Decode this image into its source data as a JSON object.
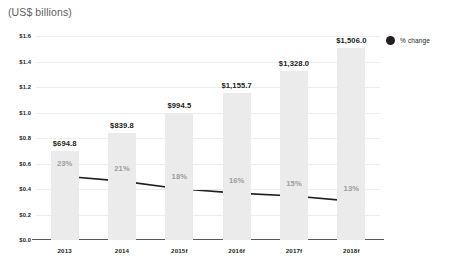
{
  "axis_unit_label": "(US$ billions)",
  "legend": {
    "marker_icon": "filled-circle-icon",
    "label": "% change",
    "color": "#231f20"
  },
  "colors": {
    "bar": "#ebebeb",
    "line": "#231f20",
    "marker": "#231f20",
    "pct_text": "#9a9c9e",
    "value_text": "#231f20",
    "gridline": "#ececec",
    "baseline": "#58595b"
  },
  "chart_data": {
    "type": "bar",
    "title": "",
    "subtitle": "",
    "xlabel": "",
    "ylabel": "(US$ billions)",
    "categories": [
      "2013",
      "2014",
      "2015f",
      "2016f",
      "2017f",
      "2018f"
    ],
    "ylim": [
      0.0,
      1.6
    ],
    "ytick_labels": [
      "$1.6",
      "$1.4",
      "$1.2",
      "$1.0",
      "$0.8",
      "$0.6",
      "$0.4",
      "$0.2",
      "$0.0"
    ],
    "ytick_values": [
      1.6,
      1.4,
      1.2,
      1.0,
      0.8,
      0.6,
      0.4,
      0.2,
      0.0
    ],
    "grid": true,
    "legend_position": "top-right",
    "series": [
      {
        "name": "Value",
        "type": "bar",
        "axis": "left",
        "values": [
          0.6948,
          0.8398,
          0.9945,
          1.1557,
          1.328,
          1.506
        ],
        "data_labels": [
          "$694.8",
          "$839.8",
          "$994.5",
          "$1,155.7",
          "$1,328.0",
          "$1,506.0"
        ]
      },
      {
        "name": "% change",
        "type": "line",
        "axis": "left-scaled",
        "values": [
          23,
          21,
          18,
          16,
          15,
          13
        ],
        "plotted_at": [
          0.5,
          0.462,
          0.402,
          0.368,
          0.345,
          0.305
        ],
        "data_labels": [
          "23%",
          "21%",
          "18%",
          "16%",
          "15%",
          "13%"
        ]
      }
    ]
  }
}
